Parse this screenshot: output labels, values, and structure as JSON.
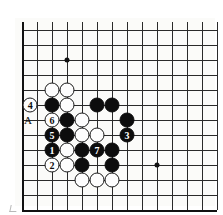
{
  "diagram": {
    "type": "go-board",
    "title": "",
    "board": {
      "cell_size": 15,
      "origin_x": 7,
      "origin_y": 12,
      "cols": 14,
      "rows": 13,
      "edge_left_col": 0,
      "edge_bottom_row": 12,
      "background_color": "#fbfbf9",
      "line_color": "#2a2a2a",
      "edge_color": "#111111"
    },
    "star_points": [
      {
        "col": 3,
        "row": 2
      },
      {
        "col": 9,
        "row": 9
      }
    ],
    "stones": [
      {
        "col": 2,
        "row": 4,
        "color": "white",
        "label": ""
      },
      {
        "col": 3,
        "row": 4,
        "color": "white",
        "label": ""
      },
      {
        "col": 2,
        "row": 5,
        "color": "black",
        "label": ""
      },
      {
        "col": 3,
        "row": 5,
        "color": "white",
        "label": ""
      },
      {
        "col": 5,
        "row": 5,
        "color": "black",
        "label": ""
      },
      {
        "col": 6,
        "row": 5,
        "color": "black",
        "label": ""
      },
      {
        "col": 2,
        "row": 6,
        "color": "white",
        "label": "6"
      },
      {
        "col": 3,
        "row": 6,
        "color": "black",
        "label": ""
      },
      {
        "col": 4,
        "row": 6,
        "color": "white",
        "label": ""
      },
      {
        "col": 7,
        "row": 6,
        "color": "black",
        "label": ""
      },
      {
        "col": 2,
        "row": 7,
        "color": "black",
        "label": "5"
      },
      {
        "col": 3,
        "row": 7,
        "color": "black",
        "label": ""
      },
      {
        "col": 4,
        "row": 7,
        "color": "white",
        "label": ""
      },
      {
        "col": 5,
        "row": 7,
        "color": "white",
        "label": ""
      },
      {
        "col": 7,
        "row": 7,
        "color": "black",
        "label": "3"
      },
      {
        "col": 2,
        "row": 8,
        "color": "black",
        "label": "1"
      },
      {
        "col": 3,
        "row": 8,
        "color": "white",
        "label": ""
      },
      {
        "col": 4,
        "row": 8,
        "color": "black",
        "label": ""
      },
      {
        "col": 5,
        "row": 8,
        "color": "black",
        "label": "7"
      },
      {
        "col": 6,
        "row": 8,
        "color": "black",
        "label": ""
      },
      {
        "col": 2,
        "row": 9,
        "color": "white",
        "label": "2"
      },
      {
        "col": 3,
        "row": 9,
        "color": "white",
        "label": ""
      },
      {
        "col": 4,
        "row": 9,
        "color": "black",
        "label": ""
      },
      {
        "col": 6,
        "row": 9,
        "color": "black",
        "label": ""
      },
      {
        "col": 4,
        "row": 10,
        "color": "white",
        "label": ""
      },
      {
        "col": 5,
        "row": 10,
        "color": "white",
        "label": ""
      },
      {
        "col": 6,
        "row": 10,
        "color": "white",
        "label": ""
      }
    ],
    "off_board_markers": [
      {
        "col": 0.55,
        "row": 5,
        "label": "4",
        "style": "white-circle"
      }
    ],
    "off_board_letters": [
      {
        "col": 0.4,
        "row": 6,
        "label": "A"
      }
    ]
  }
}
